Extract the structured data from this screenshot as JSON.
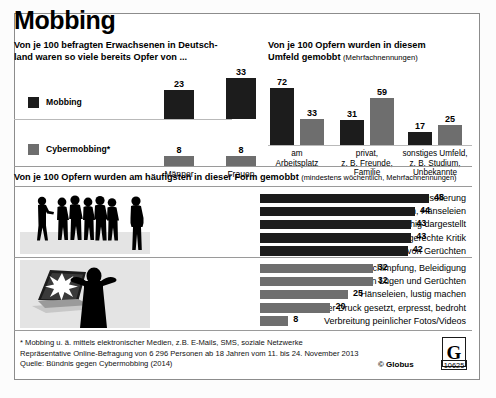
{
  "title": "Mobbing",
  "colors": {
    "dark": "#1c1c1c",
    "grey": "#6e6e6e",
    "rule": "#b9b9b9",
    "frame": "#8c8c8c"
  },
  "section1": {
    "lead_line1": "Von je 100 befragten Erwachsenen in Deutsch-",
    "lead_line2": "land waren so viele bereits Opfer von ...",
    "legend": [
      {
        "label": "Mobbing",
        "color": "#1c1c1c"
      },
      {
        "label": "Cybermobbing*",
        "color": "#6e6e6e"
      }
    ],
    "categories": [
      "Männer",
      "Frauen"
    ],
    "series": [
      {
        "name": "Mobbing",
        "values": [
          23,
          33
        ]
      },
      {
        "name": "Cybermobbing*",
        "values": [
          8,
          8
        ]
      }
    ]
  },
  "section2": {
    "lead_line1": "Von je 100 Opfern wurden in diesem",
    "lead_line2": "Umfeld gemobbt",
    "lead_note": "(Mehrfachnennungen)",
    "groups": [
      {
        "label_lines": [
          "am",
          "Arbeitsplatz"
        ],
        "dark": 72,
        "grey": 33
      },
      {
        "label_lines": [
          "privat,",
          "z. B. Freunde,",
          "Familie"
        ],
        "dark": 31,
        "grey": 59
      },
      {
        "label_lines": [
          "sonstiges Umfeld,",
          "z. B. Studium,",
          "Unbekannte"
        ],
        "dark": 17,
        "grey": 25
      }
    ]
  },
  "section3": {
    "lead": "Von je 100 Opfern wurden am häufigsten in dieser Form gemobbt",
    "lead_note": "(mindestens wöchentlich, Mehrfachnennungen)",
    "mobbing_items": [
      {
        "label": "Ausgrenzung, Isolierung",
        "value": 48
      },
      {
        "label": "Sticheleien, Hänseleien",
        "value": 44
      },
      {
        "label": "als unfähig dargestellt",
        "value": 43
      },
      {
        "label": "massive, ungerechte Kritik",
        "value": 43
      },
      {
        "label": "Verbreitung von Gerüchten",
        "value": 42
      }
    ],
    "cyber_items": [
      {
        "label": "Beschimpfung, Beleidigung",
        "value": 32
      },
      {
        "label": "Verbreitung von Lügen und Gerüchten",
        "value": 32
      },
      {
        "label": "Hänseleien, lustig machen",
        "value": 25
      },
      {
        "label": "unter Druck gesetzt, erpresst, bedroht",
        "value": 20
      },
      {
        "label": "Verbreitung peinlicher Fotos/Videos",
        "value": 8
      }
    ]
  },
  "footer": {
    "line1": "* Mobbing u. ä. mittels elektronischer Medien, z.B. E-Mails, SMS, soziale Netzwerke",
    "line2": "Repräsentative Online-Befragung von 6 296 Personen ab 18 Jahren vom 11. bis 24. November 2013",
    "line3": "Quelle: Bündnis gegen Cybermobbing (2014)",
    "copyright": "© Globus",
    "logo_letter": "G",
    "logo_number": "10625"
  }
}
